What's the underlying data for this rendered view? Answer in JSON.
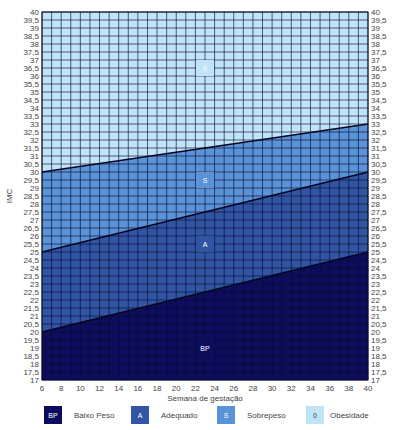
{
  "chart_data": {
    "type": "area",
    "title": "",
    "xlabel": "Semana de gestação",
    "ylabel": "IMC",
    "xlim": [
      6,
      40
    ],
    "ylim": [
      17,
      40
    ],
    "grid": true,
    "legend_position": "bottom",
    "x_ticks": [
      "6",
      "8",
      "10",
      "12",
      "14",
      "16",
      "18",
      "20",
      "22",
      "24",
      "26",
      "28",
      "30",
      "32",
      "34",
      "36",
      "38",
      "40"
    ],
    "y_ticks_left": [
      "17",
      "17,5",
      "18",
      "18,5",
      "19",
      "19,5",
      "20",
      "20,5",
      "21",
      "21,5",
      "22",
      "22,5",
      "23",
      "23,5",
      "24",
      "24,5",
      "25",
      "25,5",
      "26",
      "26,5",
      "27",
      "27,5",
      "28",
      "28,5",
      "29",
      "29,5",
      "30",
      "30,5",
      "31",
      "31,5",
      "32",
      "32,5",
      "33",
      "33,5",
      "34",
      "34,5",
      "35",
      "35,5",
      "36",
      "36,5",
      "37",
      "37,5",
      "38",
      "38,5",
      "39",
      "39,5",
      "40"
    ],
    "y_ticks_right": [
      "17",
      "17,5",
      "18",
      "18,5",
      "19",
      "19,5",
      "20",
      "20,5",
      "21",
      "21,5",
      "22",
      "22,5",
      "23",
      "23,5",
      "24",
      "24,5",
      "25",
      "25,5",
      "26",
      "26,5",
      "27",
      "27,5",
      "28",
      "28,5",
      "29",
      "29,5",
      "30",
      "30,5",
      "31",
      "31,5",
      "32",
      "32,5",
      "33",
      "33,5",
      "34",
      "34,5",
      "35",
      "35,5",
      "36",
      "36,5",
      "37",
      "37,5",
      "38",
      "38,5",
      "39",
      "39,5",
      "40"
    ],
    "boundaries": [
      {
        "name": "BP/A",
        "x": [
          6,
          40
        ],
        "y": [
          20,
          25
        ]
      },
      {
        "name": "A/S",
        "x": [
          6,
          40
        ],
        "y": [
          25,
          30
        ]
      },
      {
        "name": "S/O",
        "x": [
          6,
          40
        ],
        "y": [
          30,
          33
        ]
      }
    ],
    "series": [
      {
        "name": "Baixo Peso",
        "code": "BP",
        "color": "#0d0d5e",
        "lower": [
          17,
          17
        ],
        "upper": [
          20,
          25
        ]
      },
      {
        "name": "Adequado",
        "code": "A",
        "color": "#2f55a4",
        "lower": [
          20,
          25
        ],
        "upper": [
          25,
          30
        ]
      },
      {
        "name": "Sobrepeso",
        "code": "S",
        "color": "#5b93d9",
        "lower": [
          25,
          30
        ],
        "upper": [
          30,
          33
        ]
      },
      {
        "name": "Obesidade",
        "code": "0",
        "color": "#bfe3f7",
        "lower": [
          30,
          33
        ],
        "upper": [
          40,
          40
        ]
      }
    ],
    "zone_labels": [
      {
        "code": "0",
        "x": 23,
        "y": 36.5
      },
      {
        "code": "S",
        "x": 23,
        "y": 29.5
      },
      {
        "code": "A",
        "x": 23,
        "y": 25.5
      },
      {
        "code": "BP",
        "x": 23,
        "y": 19
      }
    ]
  },
  "legend": [
    {
      "code": "BP",
      "label": "Baixo Peso",
      "color": "#0d0d5e"
    },
    {
      "code": "A",
      "label": "Adequado",
      "color": "#2f55a4"
    },
    {
      "code": "S",
      "label": "Sobrepeso",
      "color": "#5b93d9"
    },
    {
      "code": "0",
      "label": "Obesidade",
      "color": "#bfe3f7"
    }
  ]
}
